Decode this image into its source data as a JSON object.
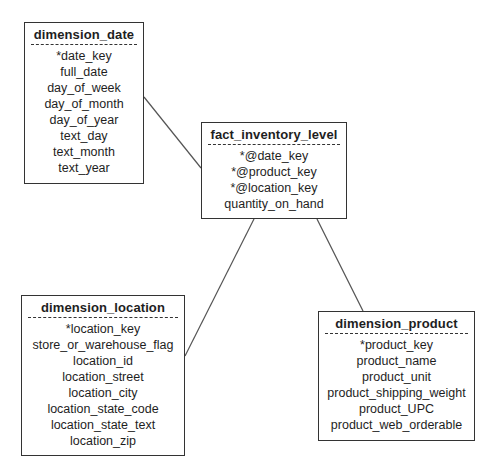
{
  "diagram": {
    "type": "star_schema",
    "entities": {
      "date": {
        "name": "dimension_date",
        "fields": [
          "*date_key",
          "full_date",
          "day_of_week",
          "day_of_month",
          "day_of_year",
          "text_day",
          "text_month",
          "text_year"
        ]
      },
      "fact": {
        "name": "fact_inventory_level",
        "fields": [
          "*@date_key",
          "*@product_key",
          "*@location_key",
          "quantity_on_hand"
        ]
      },
      "location": {
        "name": "dimension_location",
        "fields": [
          "*location_key",
          "store_or_warehouse_flag",
          "location_id",
          "location_street",
          "location_city",
          "location_state_code",
          "location_state_text",
          "location_zip"
        ]
      },
      "product": {
        "name": "dimension_product",
        "fields": [
          "*product_key",
          "product_name",
          "product_unit",
          "product_shipping_weight",
          "product_UPC",
          "product_web_orderable"
        ]
      }
    },
    "relationships": [
      {
        "from": "fact_inventory_level",
        "to": "dimension_date"
      },
      {
        "from": "fact_inventory_level",
        "to": "dimension_location"
      },
      {
        "from": "fact_inventory_level",
        "to": "dimension_product"
      }
    ],
    "legend_markers": {
      "primary_key": "*",
      "foreign_key": "@"
    },
    "colors": {
      "line": "#555555",
      "border": "#333333",
      "background": "#ffffff",
      "text": "#1e1e1e"
    }
  }
}
